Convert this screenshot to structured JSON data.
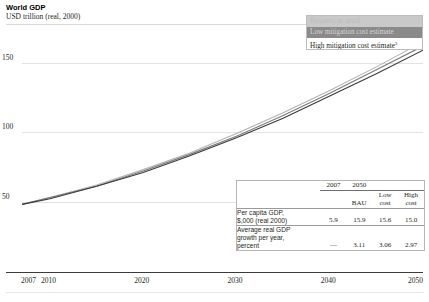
{
  "header": {
    "title": "World GDP",
    "subtitle": "USD trillion (real, 2000)"
  },
  "legend": {
    "items": [
      {
        "label": "Business as usual",
        "swatch": "#c9c9c9"
      },
      {
        "label": "Low mitigation cost estimate",
        "swatch": "#8a8a8a"
      },
      {
        "label": "High mitigation cost estimate",
        "footnote": "3",
        "swatch": "#ffffff"
      }
    ]
  },
  "table": {
    "header_2007": "2007",
    "header_2050": "2050",
    "sub_headers": [
      "BAU",
      "Low cost",
      "High cost"
    ],
    "sub_bau": "BAU",
    "sub_low_1": "Low",
    "sub_low_2": "cost",
    "sub_high_1": "High",
    "sub_high_2": "cost",
    "rows": [
      {
        "label_line1": "Per capita GDP,",
        "label_line2": "$,000 (real 2000)",
        "label_line3": "",
        "v2007": "5.9",
        "bau": "15.9",
        "low": "15.6",
        "high": "15.0"
      },
      {
        "label_line1": "Average real GDP",
        "label_line2": "growth per year,",
        "label_line3": "percent",
        "v2007": "—",
        "bau": "3.11",
        "low": "3.06",
        "high": "2.97"
      }
    ]
  },
  "chart_data": {
    "type": "line",
    "title": "World GDP",
    "subtitle": "USD trillion (real, 2000)",
    "xlabel": "",
    "ylabel": "USD trillion (real, 2000)",
    "x": [
      2007,
      2010,
      2015,
      2020,
      2025,
      2030,
      2035,
      2040,
      2045,
      2050
    ],
    "xlim": [
      2007,
      2050
    ],
    "ylim": [
      0,
      175
    ],
    "yticks": [
      50,
      100,
      150
    ],
    "ytick_labels": [
      "50",
      "100",
      "150"
    ],
    "xticks": [
      2007,
      2010,
      2020,
      2030,
      2040,
      2050
    ],
    "xtick_labels": [
      "2007",
      "2010",
      "2020",
      "2030",
      "2040",
      "2050"
    ],
    "grid": true,
    "legend_position": "top-right",
    "series": [
      {
        "name": "Business as usual",
        "color": "#b3b3b3",
        "values": [
          48,
          53,
          62,
          73,
          85,
          99,
          114,
          130,
          147,
          165
        ]
      },
      {
        "name": "Low mitigation cost estimate",
        "color": "#7a7a7a",
        "values": [
          48,
          53,
          61,
          72,
          84,
          97,
          112,
          128,
          145,
          162
        ]
      },
      {
        "name": "High mitigation cost estimate",
        "color": "#3a3a3a",
        "values": [
          48,
          52,
          61,
          71,
          83,
          96,
          110,
          126,
          142,
          159
        ]
      }
    ]
  },
  "axis": {
    "y_ticks": [
      {
        "label": "150",
        "value": 150
      },
      {
        "label": "100",
        "value": 100
      },
      {
        "label": "50",
        "value": 50
      }
    ],
    "x_ticks": [
      {
        "label": "2007",
        "value": 2007
      },
      {
        "label": "2010",
        "value": 2010
      },
      {
        "label": "2020",
        "value": 2020
      },
      {
        "label": "2030",
        "value": 2030
      },
      {
        "label": "2040",
        "value": 2040
      },
      {
        "label": "2050",
        "value": 2050
      }
    ]
  }
}
